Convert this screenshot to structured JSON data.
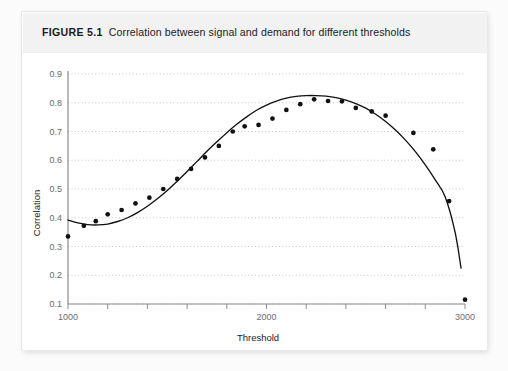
{
  "figure": {
    "label": "FIGURE 5.1",
    "caption": "Correlation between signal and demand for different thresholds"
  },
  "chart_data": {
    "type": "scatter",
    "title": "Correlation between signal and demand for different thresholds",
    "xlabel": "Threshold",
    "ylabel": "Correlation",
    "xlim": [
      1000,
      3000
    ],
    "ylim": [
      0.1,
      0.9
    ],
    "grid": true,
    "legend": null,
    "xticks": [
      1000,
      1200,
      1400,
      1600,
      1800,
      2000,
      2200,
      2400,
      2600,
      2800,
      3000
    ],
    "xtick_labels": [
      "1000",
      "",
      "",
      "",
      "",
      "2000",
      "",
      "",
      "",
      "",
      "3000"
    ],
    "yticks": [
      0.1,
      0.2,
      0.3,
      0.4,
      0.5,
      0.6,
      0.7,
      0.8,
      0.9
    ],
    "ytick_labels": [
      "0.1",
      "0.2",
      "0.3",
      "0.4",
      "0.5",
      "0.6",
      "0.7",
      "0.8",
      "0.9"
    ],
    "series": [
      {
        "name": "observed correlation",
        "type": "scatter",
        "marker": "filled-circle",
        "color": "#111111",
        "points": [
          [
            1000,
            0.335
          ],
          [
            1080,
            0.372
          ],
          [
            1140,
            0.388
          ],
          [
            1200,
            0.412
          ],
          [
            1270,
            0.427
          ],
          [
            1340,
            0.45
          ],
          [
            1410,
            0.47
          ],
          [
            1480,
            0.5
          ],
          [
            1550,
            0.535
          ],
          [
            1620,
            0.57
          ],
          [
            1690,
            0.61
          ],
          [
            1760,
            0.65
          ],
          [
            1830,
            0.7
          ],
          [
            1890,
            0.718
          ],
          [
            1960,
            0.723
          ],
          [
            2030,
            0.745
          ],
          [
            2100,
            0.775
          ],
          [
            2170,
            0.795
          ],
          [
            2240,
            0.812
          ],
          [
            2310,
            0.806
          ],
          [
            2380,
            0.805
          ],
          [
            2450,
            0.782
          ],
          [
            2530,
            0.77
          ],
          [
            2600,
            0.755
          ],
          [
            2740,
            0.695
          ],
          [
            2840,
            0.638
          ],
          [
            2920,
            0.458
          ],
          [
            3000,
            0.115
          ]
        ]
      },
      {
        "name": "fitted curve",
        "type": "line",
        "color": "#111111",
        "points": [
          [
            1000,
            0.392
          ],
          [
            1050,
            0.382
          ],
          [
            1100,
            0.376
          ],
          [
            1150,
            0.375
          ],
          [
            1200,
            0.378
          ],
          [
            1250,
            0.387
          ],
          [
            1300,
            0.4
          ],
          [
            1350,
            0.418
          ],
          [
            1400,
            0.44
          ],
          [
            1450,
            0.466
          ],
          [
            1500,
            0.495
          ],
          [
            1550,
            0.527
          ],
          [
            1600,
            0.561
          ],
          [
            1650,
            0.596
          ],
          [
            1700,
            0.631
          ],
          [
            1750,
            0.664
          ],
          [
            1800,
            0.696
          ],
          [
            1850,
            0.725
          ],
          [
            1900,
            0.751
          ],
          [
            1950,
            0.774
          ],
          [
            2000,
            0.792
          ],
          [
            2050,
            0.806
          ],
          [
            2100,
            0.816
          ],
          [
            2150,
            0.822
          ],
          [
            2200,
            0.825
          ],
          [
            2250,
            0.825
          ],
          [
            2300,
            0.823
          ],
          [
            2350,
            0.818
          ],
          [
            2400,
            0.809
          ],
          [
            2450,
            0.797
          ],
          [
            2500,
            0.781
          ],
          [
            2550,
            0.76
          ],
          [
            2600,
            0.735
          ],
          [
            2650,
            0.705
          ],
          [
            2700,
            0.67
          ],
          [
            2750,
            0.63
          ],
          [
            2800,
            0.584
          ],
          [
            2850,
            0.532
          ],
          [
            2900,
            0.473
          ],
          [
            2950,
            0.35
          ],
          [
            2980,
            0.225
          ]
        ]
      }
    ]
  }
}
